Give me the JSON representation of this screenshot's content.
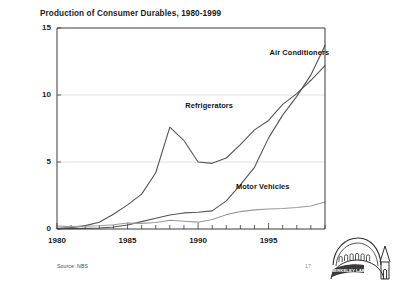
{
  "slide": {
    "source_note": "Source: NBS",
    "page_number": "17",
    "logo_text": "BERKELEY LAB",
    "logo_name": "berkeley-lab-logo"
  },
  "chart_data": {
    "type": "line",
    "title": "Production of Consumer Durables, 1980-1999",
    "xlabel": "",
    "ylabel": "",
    "xlim": [
      1980,
      1999
    ],
    "ylim": [
      0,
      15
    ],
    "grid": true,
    "legend": "inline-annotations",
    "y_ticks": [
      0,
      5,
      10,
      15
    ],
    "y_tick_labels": [
      "0",
      "5",
      "10",
      "15"
    ],
    "x_ticks": [
      1980,
      1985,
      1990,
      1995
    ],
    "x_tick_labels": [
      "1980",
      "1985",
      "1990",
      "1995"
    ],
    "x": [
      1980,
      1981,
      1982,
      1983,
      1984,
      1985,
      1986,
      1987,
      1988,
      1989,
      1990,
      1991,
      1992,
      1993,
      1994,
      1995,
      1996,
      1997,
      1998,
      1999
    ],
    "series": [
      {
        "name": "Air Conditioners",
        "color": "#555555",
        "label_x": 1997.2,
        "label_y": 13.1,
        "values": [
          0.02,
          0.03,
          0.05,
          0.08,
          0.15,
          0.3,
          0.55,
          0.8,
          1.05,
          1.2,
          1.25,
          1.35,
          2.1,
          3.3,
          4.6,
          6.8,
          8.5,
          9.9,
          11.5,
          13.7
        ]
      },
      {
        "name": "Refrigerators",
        "color": "#555555",
        "label_x": 1990.8,
        "label_y": 9.2,
        "values": [
          0.05,
          0.1,
          0.25,
          0.5,
          1.1,
          1.8,
          2.6,
          4.2,
          7.6,
          6.6,
          5.0,
          4.9,
          5.3,
          6.3,
          7.4,
          8.1,
          9.3,
          10.1,
          11.1,
          12.2
        ]
      },
      {
        "name": "Motor Vehicles",
        "color": "#9a9a9a",
        "label_x": 1994.6,
        "label_y": 3.1,
        "values": [
          0.22,
          0.18,
          0.2,
          0.24,
          0.32,
          0.45,
          0.42,
          0.48,
          0.65,
          0.58,
          0.51,
          0.71,
          1.07,
          1.3,
          1.43,
          1.49,
          1.53,
          1.6,
          1.72,
          2.02
        ]
      }
    ]
  }
}
